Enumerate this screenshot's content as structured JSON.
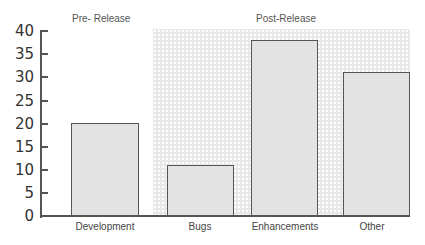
{
  "chart_data": {
    "type": "bar",
    "title": "",
    "xlabel": "",
    "ylabel": "",
    "categories": [
      "Development",
      "Bugs",
      "Enhancements",
      "Other"
    ],
    "values": [
      20,
      11,
      38,
      31
    ],
    "ylim": [
      0,
      40
    ],
    "yticks": [
      0,
      5,
      10,
      15,
      20,
      25,
      30,
      35,
      40
    ],
    "grid": false,
    "legend": null,
    "annotations": [
      {
        "text": "Pre- Release",
        "region": "Development"
      },
      {
        "text": "Post-Release",
        "region": "Bugs, Enhancements, Other",
        "style": "shaded patterned background"
      }
    ]
  },
  "labels": {
    "pre_release": "Pre- Release",
    "post_release": "Post-Release"
  },
  "ticks": [
    "0",
    "5",
    "10",
    "15",
    "20",
    "25",
    "30",
    "35",
    "40"
  ],
  "categories": [
    "Development",
    "Bugs",
    "Enhancements",
    "Other"
  ]
}
